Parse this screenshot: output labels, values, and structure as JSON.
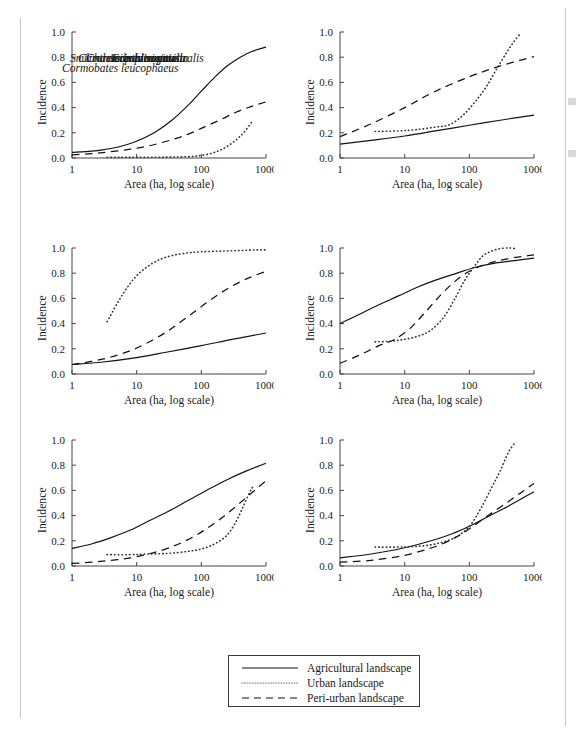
{
  "figure": {
    "type": "multi-panel-line-chart",
    "panel_count": 6,
    "shared_xlabel": "Area (ha, log scale)",
    "shared_ylabel": "Incidence",
    "x_ticks": [
      "1",
      "10",
      "100",
      "1000"
    ],
    "y_ticks": [
      "0.0",
      "0.2",
      "0.4",
      "0.6",
      "0.8",
      "1.0"
    ]
  },
  "legend": {
    "title": "",
    "entries": [
      {
        "label": "Agricultural landscape",
        "style": "solid",
        "swatch": "solid-line-swatch"
      },
      {
        "label": "Urban landscape",
        "style": "dotted",
        "swatch": "dotted-line-swatch"
      },
      {
        "label": "Peri-urban landscape",
        "style": "dashed",
        "swatch": "dashed-line-swatch"
      }
    ]
  },
  "panels": [
    {
      "id": "p1",
      "species": "Eopsaltria australis"
    },
    {
      "id": "p2",
      "species": "Acanthiza pusilla"
    },
    {
      "id": "p3",
      "species": "Smicrornis brevirostris"
    },
    {
      "id": "p4",
      "species": "Cormobates leucophaeus"
    },
    {
      "id": "p5",
      "species": "Climacteris picumnus"
    },
    {
      "id": "p6",
      "species": "Chthonicola sagittata"
    }
  ],
  "chart_data": {
    "type": "line",
    "title": "",
    "xlabel": "Area (ha, log scale)",
    "ylabel": "Incidence",
    "xscale": "log",
    "xlim": [
      1,
      1000
    ],
    "ylim": [
      0,
      1
    ],
    "xticks": [
      1,
      10,
      100,
      1000
    ],
    "yticks": [
      0.0,
      0.2,
      0.4,
      0.6,
      0.8,
      1.0
    ],
    "grid": false,
    "legend_position": "below-figure-center",
    "legend_entries": [
      "Agricultural landscape",
      "Urban landscape",
      "Peri-urban landscape"
    ],
    "panels": [
      {
        "title": "Eopsaltria australis",
        "series": [
          {
            "name": "Agricultural landscape",
            "style": "solid",
            "x": [
              1,
              2,
              3,
              5,
              8,
              12,
              20,
              35,
              60,
              100,
              160,
              250,
              400,
              600,
              1000
            ],
            "y": [
              0.045,
              0.055,
              0.065,
              0.085,
              0.115,
              0.15,
              0.21,
              0.3,
              0.41,
              0.53,
              0.64,
              0.73,
              0.8,
              0.845,
              0.88
            ]
          },
          {
            "name": "Urban landscape",
            "style": "dotted",
            "x": [
              3.5,
              6,
              10,
              20,
              40,
              70,
              100,
              150,
              220,
              320,
              450,
              600
            ],
            "y": [
              0.005,
              0.005,
              0.005,
              0.006,
              0.008,
              0.012,
              0.02,
              0.04,
              0.075,
              0.13,
              0.2,
              0.285
            ]
          },
          {
            "name": "Peri-urban landscape",
            "style": "dashed",
            "x": [
              1,
              2,
              4,
              8,
              15,
              30,
              60,
              110,
              200,
              350,
              600,
              1000
            ],
            "y": [
              0.025,
              0.035,
              0.05,
              0.07,
              0.095,
              0.135,
              0.185,
              0.245,
              0.305,
              0.365,
              0.41,
              0.445
            ]
          }
        ]
      },
      {
        "title": "Acanthiza pusilla",
        "series": [
          {
            "name": "Agricultural landscape",
            "style": "solid",
            "x": [
              1,
              3,
              10,
              30,
              100,
              300,
              1000
            ],
            "y": [
              0.11,
              0.14,
              0.175,
              0.215,
              0.26,
              0.3,
              0.34
            ]
          },
          {
            "name": "Urban landscape",
            "style": "dotted",
            "x": [
              3.5,
              8,
              15,
              30,
              50,
              80,
              120,
              180,
              260,
              380,
              500,
              600
            ],
            "y": [
              0.21,
              0.215,
              0.225,
              0.245,
              0.265,
              0.34,
              0.44,
              0.56,
              0.7,
              0.84,
              0.93,
              0.98
            ]
          },
          {
            "name": "Peri-urban landscape",
            "style": "dashed",
            "x": [
              1,
              3,
              10,
              30,
              100,
              300,
              1000
            ],
            "y": [
              0.17,
              0.27,
              0.4,
              0.53,
              0.645,
              0.73,
              0.805
            ]
          }
        ]
      },
      {
        "title": "Smicrornis brevirostris",
        "series": [
          {
            "name": "Agricultural landscape",
            "style": "solid",
            "x": [
              1,
              3,
              10,
              30,
              100,
              300,
              1000
            ],
            "y": [
              0.075,
              0.095,
              0.13,
              0.175,
              0.225,
              0.275,
              0.325
            ]
          },
          {
            "name": "Urban landscape",
            "style": "dotted",
            "x": [
              3.5,
              5,
              7,
              10,
              15,
              22,
              35,
              60,
              100,
              200,
              400,
              700,
              1000
            ],
            "y": [
              0.415,
              0.56,
              0.68,
              0.78,
              0.855,
              0.905,
              0.94,
              0.96,
              0.97,
              0.975,
              0.98,
              0.985,
              0.985
            ]
          },
          {
            "name": "Peri-urban landscape",
            "style": "dashed",
            "x": [
              1,
              2,
              4,
              8,
              15,
              30,
              60,
              120,
              250,
              500,
              1000
            ],
            "y": [
              0.075,
              0.1,
              0.135,
              0.185,
              0.25,
              0.34,
              0.45,
              0.565,
              0.675,
              0.755,
              0.815
            ]
          }
        ]
      },
      {
        "title": "Cormobates leucophaeus",
        "series": [
          {
            "name": "Agricultural landscape",
            "style": "solid",
            "x": [
              1,
              2,
              4,
              8,
              15,
              30,
              60,
              120,
              250,
              500,
              1000
            ],
            "y": [
              0.4,
              0.475,
              0.55,
              0.62,
              0.685,
              0.745,
              0.795,
              0.845,
              0.88,
              0.9,
              0.92
            ]
          },
          {
            "name": "Urban landscape",
            "style": "dotted",
            "x": [
              3.5,
              6,
              10,
              16,
              25,
              40,
              60,
              85,
              120,
              160,
              220,
              300,
              420,
              520
            ],
            "y": [
              0.255,
              0.26,
              0.275,
              0.3,
              0.345,
              0.45,
              0.6,
              0.745,
              0.855,
              0.935,
              0.975,
              0.995,
              1.0,
              0.995
            ]
          },
          {
            "name": "Peri-urban landscape",
            "style": "dashed",
            "x": [
              1,
              2,
              4,
              7,
              12,
              20,
              35,
              60,
              100,
              180,
              350,
              700,
              1000
            ],
            "y": [
              0.085,
              0.15,
              0.225,
              0.275,
              0.36,
              0.48,
              0.62,
              0.735,
              0.815,
              0.87,
              0.91,
              0.935,
              0.945
            ]
          }
        ]
      },
      {
        "title": "Climacteris picumnus",
        "series": [
          {
            "name": "Agricultural landscape",
            "style": "solid",
            "x": [
              1,
              2,
              4,
              8,
              15,
              30,
              60,
              120,
              250,
              500,
              1000
            ],
            "y": [
              0.14,
              0.175,
              0.225,
              0.285,
              0.355,
              0.43,
              0.515,
              0.6,
              0.685,
              0.755,
              0.815
            ]
          },
          {
            "name": "Urban landscape",
            "style": "dotted",
            "x": [
              3.5,
              8,
              15,
              30,
              60,
              100,
              160,
              250,
              350,
              450,
              560,
              620
            ],
            "y": [
              0.09,
              0.09,
              0.095,
              0.1,
              0.115,
              0.135,
              0.175,
              0.245,
              0.36,
              0.48,
              0.585,
              0.625
            ]
          },
          {
            "name": "Peri-urban landscape",
            "style": "dashed",
            "x": [
              1,
              2,
              4,
              8,
              15,
              30,
              60,
              120,
              250,
              500,
              800,
              1000
            ],
            "y": [
              0.02,
              0.03,
              0.045,
              0.065,
              0.095,
              0.14,
              0.205,
              0.295,
              0.415,
              0.545,
              0.635,
              0.675
            ]
          }
        ]
      },
      {
        "title": "Chthonicola sagittata",
        "series": [
          {
            "name": "Agricultural landscape",
            "style": "solid",
            "x": [
              1,
              3,
              10,
              30,
              60,
              100,
              200,
              400,
              700,
              1000
            ],
            "y": [
              0.065,
              0.095,
              0.145,
              0.21,
              0.265,
              0.315,
              0.395,
              0.475,
              0.545,
              0.59
            ]
          },
          {
            "name": "Urban landscape",
            "style": "dotted",
            "x": [
              3.5,
              8,
              15,
              30,
              60,
              100,
              150,
              220,
              300,
              400,
              500
            ],
            "y": [
              0.15,
              0.15,
              0.155,
              0.175,
              0.225,
              0.315,
              0.455,
              0.62,
              0.755,
              0.9,
              0.975
            ]
          },
          {
            "name": "Peri-urban landscape",
            "style": "dashed",
            "x": [
              1,
              3,
              10,
              30,
              60,
              100,
              200,
              400,
              700,
              1000
            ],
            "y": [
              0.03,
              0.045,
              0.085,
              0.155,
              0.225,
              0.295,
              0.405,
              0.51,
              0.6,
              0.655
            ]
          }
        ]
      }
    ]
  }
}
